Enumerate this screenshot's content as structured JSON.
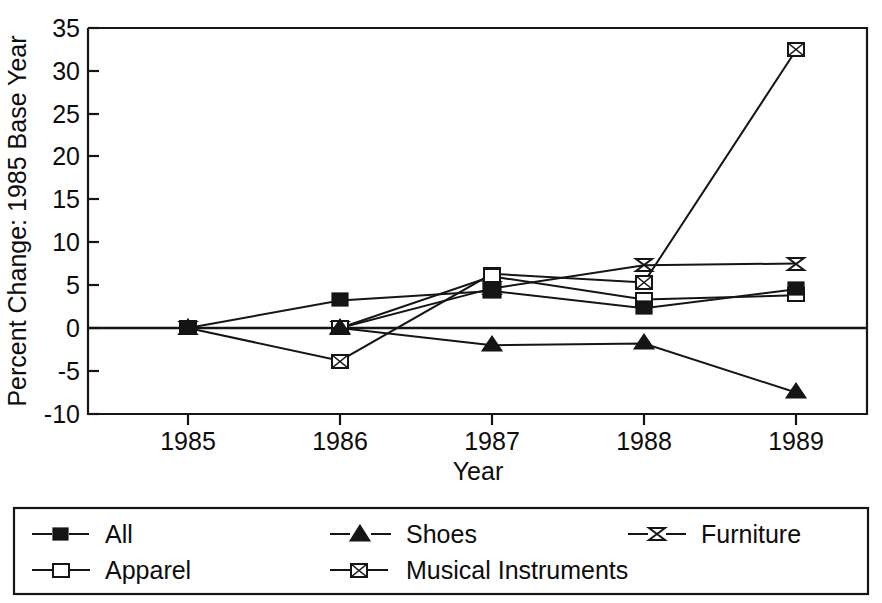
{
  "chart_data": {
    "type": "line",
    "title": "",
    "xlabel": "Year",
    "ylabel": "Percent Change: 1985 Base Year",
    "categories": [
      "1985",
      "1986",
      "1987",
      "1988",
      "1989"
    ],
    "x": [
      1985,
      1986,
      1987,
      1988,
      1989
    ],
    "xlim": [
      1984.6,
      1989.4
    ],
    "ylim": [
      -10,
      35
    ],
    "yticks": [
      "-10",
      "-5",
      "0",
      "5",
      "10",
      "15",
      "20",
      "25",
      "30",
      "35"
    ],
    "ytick_values": [
      -10,
      -5,
      0,
      5,
      10,
      15,
      20,
      25,
      30,
      35
    ],
    "xticks": [
      "1985",
      "1986",
      "1987",
      "1988",
      "1989"
    ],
    "grid": false,
    "legend_position": "bottom",
    "zero_reference_line": 0,
    "series": [
      {
        "name": "All",
        "marker": "filled-square",
        "values": [
          0,
          3.2,
          4.3,
          2.3,
          4.5
        ]
      },
      {
        "name": "Apparel",
        "marker": "open-square",
        "values": [
          0,
          0,
          6.0,
          3.3,
          3.8
        ]
      },
      {
        "name": "Shoes",
        "marker": "filled-triangle",
        "values": [
          0,
          0,
          -2.0,
          -1.8,
          -7.5
        ]
      },
      {
        "name": "Musical Instruments",
        "marker": "crossed-square",
        "values": [
          0,
          -3.8,
          6.3,
          5.3,
          32.3
        ]
      },
      {
        "name": "Furniture",
        "marker": "bowtie",
        "values": [
          0,
          0,
          4.6,
          7.3,
          7.5
        ]
      }
    ]
  },
  "legend": {
    "entries": [
      {
        "label": "All",
        "marker": "filled-square"
      },
      {
        "label": "Shoes",
        "marker": "filled-triangle"
      },
      {
        "label": "Furniture",
        "marker": "bowtie"
      },
      {
        "label": "Apparel",
        "marker": "open-square"
      },
      {
        "label": "Musical Instruments",
        "marker": "crossed-square"
      }
    ]
  },
  "colors": {
    "ink": "#151515",
    "background": "#ffffff"
  }
}
